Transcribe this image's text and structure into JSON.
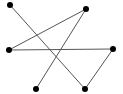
{
  "diagram": {
    "type": "graph",
    "width": 123,
    "height": 94,
    "colors": {
      "edge": "#555555",
      "node": "#000000",
      "background": "#ffffff"
    },
    "node_radius": 3,
    "edge_width": 1,
    "nodes": [
      {
        "id": "n1",
        "x": 10,
        "y": 5
      },
      {
        "id": "n2",
        "x": 86,
        "y": 9
      },
      {
        "id": "n3",
        "x": 9,
        "y": 50
      },
      {
        "id": "n4",
        "x": 113,
        "y": 49
      },
      {
        "id": "n5",
        "x": 36,
        "y": 89
      },
      {
        "id": "n6",
        "x": 85,
        "y": 89
      }
    ],
    "edges": [
      {
        "from": "n1",
        "to": "n6"
      },
      {
        "from": "n2",
        "to": "n3"
      },
      {
        "from": "n2",
        "to": "n5"
      },
      {
        "from": "n3",
        "to": "n4"
      },
      {
        "from": "n4",
        "to": "n6"
      }
    ]
  }
}
